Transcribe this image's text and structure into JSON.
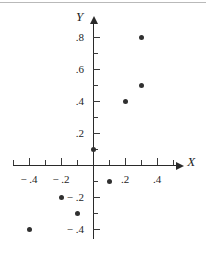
{
  "chart_data": {
    "type": "scatter",
    "title": "",
    "xlabel": "X",
    "ylabel": "Y",
    "xlim": [
      -0.5,
      0.52
    ],
    "ylim": [
      -0.46,
      0.88
    ],
    "grid": false,
    "legend": null,
    "x_tick_step": 0.1,
    "y_tick_step": 0.1,
    "x_major_ticks": [
      -0.4,
      -0.2,
      0.2,
      0.4
    ],
    "y_major_ticks": [
      -0.4,
      -0.2,
      0.2,
      0.4,
      0.6,
      0.8
    ],
    "x_tick_labels": [
      {
        "value": -0.4,
        "text": "− .4"
      },
      {
        "value": -0.2,
        "text": "− .2"
      },
      {
        "value": 0.2,
        "text": ".2"
      },
      {
        "value": 0.4,
        "text": ".4"
      }
    ],
    "y_tick_labels": [
      {
        "value": 0.8,
        "text": ".8"
      },
      {
        "value": 0.6,
        "text": ".6"
      },
      {
        "value": 0.4,
        "text": ".4"
      },
      {
        "value": 0.2,
        "text": ".2"
      },
      {
        "value": -0.2,
        "text": "− .2"
      },
      {
        "value": -0.4,
        "text": "− .4"
      }
    ],
    "points": [
      {
        "x": -0.4,
        "y": -0.4
      },
      {
        "x": -0.2,
        "y": -0.2
      },
      {
        "x": -0.1,
        "y": -0.3
      },
      {
        "x": 0.0,
        "y": 0.1
      },
      {
        "x": 0.1,
        "y": -0.1
      },
      {
        "x": 0.2,
        "y": 0.4
      },
      {
        "x": 0.3,
        "y": 0.5
      },
      {
        "x": 0.3,
        "y": 0.8
      }
    ],
    "marker_color": "#303030",
    "axis_color": "#2a2a2a"
  },
  "labels": {
    "x_axis": "X",
    "y_axis": "Y"
  }
}
